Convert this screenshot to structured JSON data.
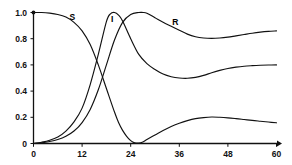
{
  "chart_data": {
    "type": "line",
    "title": "",
    "subtitle": "",
    "xlabel": "",
    "ylabel": "",
    "xlim": [
      0,
      60
    ],
    "ylim": [
      0,
      1.0
    ],
    "grid": false,
    "legend_position": "inline-annotations",
    "x_ticks": [
      0,
      12,
      24,
      36,
      48,
      60
    ],
    "x_tick_labels": [
      "0",
      "12",
      "24",
      "36",
      "48",
      "60"
    ],
    "y_ticks": [
      0,
      0.2,
      0.4,
      0.6,
      0.8,
      1.0
    ],
    "y_tick_labels": [
      "0",
      "0.2",
      "0.4",
      "0.6",
      "0.8",
      "1.0"
    ],
    "annotations": [
      {
        "text": "S",
        "x": 9.6,
        "y": 0.945
      },
      {
        "text": "I",
        "x": 19.4,
        "y": 0.925
      },
      {
        "text": "R",
        "x": 35.0,
        "y": 0.905
      }
    ],
    "series": [
      {
        "name": "S",
        "label": "S",
        "color": "#111111",
        "x": [
          0,
          2,
          4,
          6,
          8,
          10,
          12,
          14,
          16,
          18,
          20,
          21,
          22,
          23,
          24,
          25,
          26,
          27,
          28,
          30,
          32,
          34,
          36,
          38,
          40,
          42,
          44,
          46,
          48,
          50,
          52,
          54,
          56,
          58,
          60
        ],
        "y": [
          1.0,
          1.0,
          0.995,
          0.985,
          0.965,
          0.925,
          0.86,
          0.755,
          0.6,
          0.42,
          0.24,
          0.16,
          0.1,
          0.055,
          0.022,
          0.005,
          0.003,
          0.012,
          0.03,
          0.065,
          0.1,
          0.13,
          0.155,
          0.175,
          0.19,
          0.198,
          0.202,
          0.2,
          0.196,
          0.19,
          0.183,
          0.176,
          0.17,
          0.164,
          0.158
        ]
      },
      {
        "name": "I",
        "label": "I",
        "color": "#111111",
        "x": [
          0,
          2,
          4,
          6,
          8,
          10,
          12,
          14,
          16,
          18,
          19,
          20,
          21,
          22,
          24,
          26,
          28,
          30,
          32,
          34,
          36,
          38,
          40,
          42,
          44,
          46,
          48,
          50,
          52,
          54,
          56,
          58,
          60
        ],
        "y": [
          0.0,
          0.01,
          0.025,
          0.05,
          0.095,
          0.165,
          0.27,
          0.45,
          0.68,
          0.93,
          0.99,
          1.0,
          0.98,
          0.935,
          0.8,
          0.68,
          0.61,
          0.565,
          0.53,
          0.51,
          0.5,
          0.498,
          0.505,
          0.52,
          0.54,
          0.558,
          0.573,
          0.583,
          0.59,
          0.594,
          0.597,
          0.599,
          0.6
        ]
      },
      {
        "name": "R",
        "label": "R",
        "color": "#111111",
        "x": [
          0,
          2,
          4,
          6,
          8,
          10,
          12,
          14,
          16,
          18,
          20,
          22,
          24,
          26,
          27,
          28,
          30,
          32,
          34,
          36,
          38,
          40,
          42,
          44,
          46,
          48,
          50,
          52,
          54,
          56,
          58,
          60
        ],
        "y": [
          0.0,
          0.005,
          0.015,
          0.03,
          0.055,
          0.095,
          0.16,
          0.26,
          0.41,
          0.6,
          0.79,
          0.925,
          0.985,
          1.0,
          1.0,
          0.995,
          0.96,
          0.925,
          0.895,
          0.865,
          0.835,
          0.815,
          0.805,
          0.802,
          0.805,
          0.812,
          0.822,
          0.832,
          0.842,
          0.85,
          0.856,
          0.86
        ]
      }
    ]
  }
}
